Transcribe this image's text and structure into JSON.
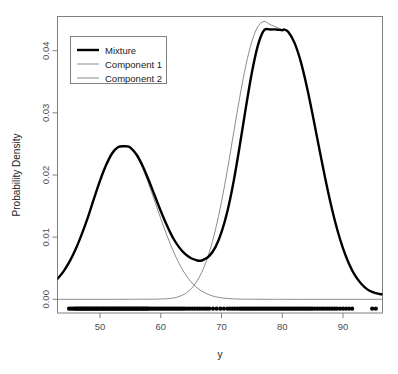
{
  "chart_data": {
    "type": "line",
    "title": "",
    "xlabel": "y",
    "ylabel": "Probability Density",
    "xlim": [
      43.0,
      96.5
    ],
    "ylim": [
      -0.0022,
      0.0455
    ],
    "grid": false,
    "legend_position": "top-left",
    "xticks": [
      50,
      60,
      70,
      80,
      90
    ],
    "xtick_labels": [
      "50",
      "60",
      "70",
      "80",
      "90"
    ],
    "yticks": [
      0.0,
      0.01,
      0.02,
      0.03,
      0.04
    ],
    "ytick_labels": [
      "0.00",
      "0.01",
      "0.02",
      "0.03",
      "0.04"
    ],
    "series": [
      {
        "name": "Mixture",
        "style": "thick-black",
        "color": "#000000",
        "linewidth": 2.4,
        "x": [
          43.0,
          44.0,
          45.0,
          46.0,
          47.0,
          48.0,
          49.0,
          50.0,
          51.0,
          52.0,
          53.0,
          54.0,
          54.5,
          55.0,
          56.0,
          57.0,
          58.0,
          59.0,
          60.0,
          61.0,
          62.0,
          63.0,
          64.0,
          65.0,
          66.0,
          66.5,
          67.0,
          68.0,
          69.0,
          70.0,
          71.0,
          72.0,
          73.0,
          74.0,
          75.0,
          76.0,
          77.0,
          78.0,
          79.0,
          80.0,
          80.3,
          81.0,
          82.0,
          83.0,
          84.0,
          85.0,
          86.0,
          87.0,
          88.0,
          89.0,
          90.0,
          91.0,
          92.0,
          93.0,
          94.0,
          95.0,
          96.0,
          96.5
        ],
        "y": [
          0.0033,
          0.0045,
          0.0061,
          0.0081,
          0.0105,
          0.0132,
          0.0162,
          0.0191,
          0.0216,
          0.0235,
          0.0245,
          0.02462,
          0.0246,
          0.0244,
          0.0233,
          0.0215,
          0.0192,
          0.0167,
          0.0142,
          0.0119,
          0.0099,
          0.0084,
          0.0073,
          0.0066,
          0.00625,
          0.0062,
          0.00635,
          0.007,
          0.0084,
          0.0108,
          0.0143,
          0.019,
          0.0247,
          0.0308,
          0.0365,
          0.0409,
          0.0433,
          0.0434,
          0.04342,
          0.0433,
          0.0434,
          0.043,
          0.0413,
          0.0384,
          0.0344,
          0.0297,
          0.0247,
          0.0198,
          0.0153,
          0.0114,
          0.0082,
          0.0057,
          0.0038,
          0.0025,
          0.0016,
          0.0011,
          0.00085,
          0.0008
        ]
      },
      {
        "name": "Component 1",
        "style": "thin-gray",
        "color": "#6e6e6e",
        "linewidth": 0.8,
        "x": [
          43.0,
          44.0,
          45.0,
          46.0,
          47.0,
          48.0,
          49.0,
          50.0,
          51.0,
          52.0,
          53.0,
          54.0,
          54.5,
          55.0,
          56.0,
          57.0,
          58.0,
          59.0,
          60.0,
          61.0,
          62.0,
          63.0,
          64.0,
          65.0,
          66.0,
          67.0,
          68.0,
          69.0,
          70.0,
          71.0,
          72.0,
          73.0,
          74.0,
          76.0,
          78.0,
          80.0,
          84.0,
          88.0,
          92.0,
          96.5
        ],
        "y": [
          0.0033,
          0.0045,
          0.0061,
          0.0081,
          0.0105,
          0.0132,
          0.0161,
          0.0189,
          0.0214,
          0.0233,
          0.0244,
          0.0246,
          0.02458,
          0.0243,
          0.0231,
          0.0211,
          0.0186,
          0.0158,
          0.013,
          0.0103,
          0.0079,
          0.0058,
          0.0041,
          0.0028,
          0.00185,
          0.00118,
          0.00072,
          0.00042,
          0.00024,
          0.00013,
          7e-05,
          4e-05,
          2e-05,
          1e-05,
          0.0,
          0.0,
          0.0,
          0.0,
          0.0,
          0.0
        ]
      },
      {
        "name": "Component 2",
        "style": "thin-gray",
        "color": "#6e6e6e",
        "linewidth": 0.8,
        "x": [
          43.0,
          50.0,
          56.0,
          60.0,
          62.0,
          63.0,
          64.0,
          65.0,
          66.0,
          67.0,
          68.0,
          69.0,
          70.0,
          71.0,
          72.0,
          73.0,
          74.0,
          75.0,
          76.0,
          77.0,
          78.0,
          79.0,
          80.0,
          80.3,
          81.0,
          82.0,
          83.0,
          84.0,
          85.0,
          86.0,
          87.0,
          88.0,
          89.0,
          90.0,
          91.0,
          92.0,
          93.0,
          94.0,
          95.0,
          96.0,
          96.5
        ],
        "y": [
          0.0,
          0.0,
          1e-05,
          5e-05,
          0.0002,
          0.00045,
          0.0009,
          0.0017,
          0.003,
          0.0049,
          0.0076,
          0.0112,
          0.0157,
          0.021,
          0.0268,
          0.0325,
          0.0376,
          0.0415,
          0.0439,
          0.0447,
          0.0442,
          0.0438,
          0.0434,
          0.04342,
          0.043,
          0.0413,
          0.0384,
          0.0344,
          0.0297,
          0.0247,
          0.0198,
          0.0153,
          0.0114,
          0.0082,
          0.0057,
          0.0038,
          0.0025,
          0.0016,
          0.0011,
          0.00085,
          0.0008
        ]
      }
    ],
    "rug": {
      "name": "data-points",
      "y_value": -0.0015,
      "marker": "filled-circle",
      "color": "#000000",
      "count": 300,
      "x": [
        44.9,
        45.2,
        45.5,
        45.8,
        46.0,
        46.2,
        46.4,
        46.6,
        46.8,
        47.0,
        47.2,
        47.4,
        47.6,
        47.8,
        48.0,
        48.2,
        48.4,
        48.6,
        48.8,
        49.0,
        49.2,
        49.4,
        49.6,
        49.8,
        50.0,
        50.2,
        50.4,
        50.6,
        50.8,
        51.0,
        51.2,
        51.4,
        51.6,
        51.8,
        52.0,
        52.2,
        52.4,
        52.6,
        52.8,
        53.0,
        53.2,
        53.4,
        53.6,
        53.8,
        54.0,
        54.2,
        54.4,
        54.6,
        54.8,
        55.0,
        55.2,
        55.4,
        55.6,
        55.8,
        56.0,
        56.2,
        56.4,
        56.6,
        56.8,
        57.0,
        57.2,
        57.4,
        57.6,
        57.8,
        58.0,
        58.3,
        58.6,
        58.9,
        59.2,
        59.5,
        59.8,
        60.1,
        60.4,
        60.7,
        61.0,
        61.3,
        61.6,
        61.9,
        62.2,
        62.5,
        62.8,
        63.1,
        63.4,
        63.7,
        64.0,
        64.4,
        64.8,
        65.2,
        65.6,
        66.0,
        66.4,
        66.8,
        67.2,
        67.6,
        68.0,
        68.6,
        69.2,
        69.8,
        70.4,
        71.0,
        71.4,
        71.8,
        72.2,
        72.6,
        73.0,
        73.3,
        73.6,
        73.9,
        74.2,
        74.5,
        74.8,
        75.1,
        75.4,
        75.7,
        76.0,
        76.3,
        76.6,
        76.9,
        77.2,
        77.5,
        77.8,
        78.1,
        78.4,
        78.7,
        79.0,
        79.3,
        79.6,
        79.9,
        80.2,
        80.5,
        80.8,
        81.1,
        81.4,
        81.7,
        82.0,
        82.3,
        82.6,
        82.9,
        83.2,
        83.5,
        83.8,
        84.1,
        84.4,
        84.7,
        85.0,
        85.4,
        85.8,
        86.2,
        86.6,
        87.0,
        87.4,
        87.8,
        88.2,
        88.6,
        89.0,
        89.5,
        90.0,
        90.5,
        91.0,
        91.5,
        94.8,
        95.4
      ]
    }
  },
  "legend": {
    "items": [
      {
        "label": "Mixture"
      },
      {
        "label": "Component 1"
      },
      {
        "label": "Component 2"
      }
    ]
  },
  "axes": {
    "x_title": "y",
    "y_title": "Probability Density"
  }
}
